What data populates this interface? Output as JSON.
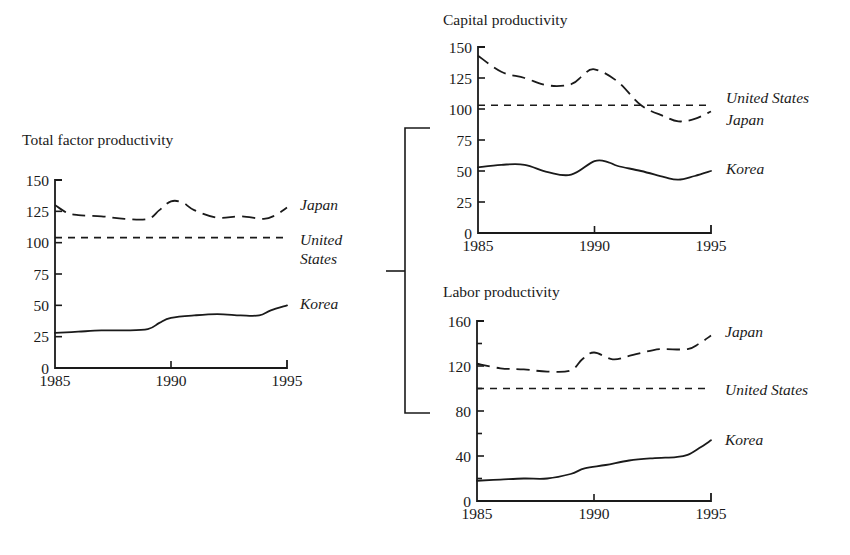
{
  "figure": {
    "bracket": {
      "x": 405,
      "top": 128,
      "bottom": 413,
      "arm_right": 430,
      "mid_y": 271,
      "stub_left": 386
    }
  },
  "chart_data": [
    {
      "id": "tfp",
      "type": "line",
      "title": "Total factor productivity",
      "xlabel": "",
      "ylabel": "",
      "x_ticks": [
        1985,
        1990,
        1995
      ],
      "y_ticks": [
        0,
        25,
        50,
        75,
        100,
        125,
        150
      ],
      "xlim": [
        1985,
        1995
      ],
      "ylim": [
        0,
        150
      ],
      "grid": false,
      "legend_position": "inline-right",
      "layout": {
        "title_x": 22,
        "title_y": 145,
        "x0": 55,
        "x1": 287,
        "y_top": 180,
        "y_bottom": 368
      },
      "series": [
        {
          "name": "Japan",
          "style": "longdash",
          "label_lines": [
            "Japan"
          ],
          "label_x": 300,
          "label_y": 210,
          "x": [
            1985,
            1985.5,
            1986,
            1987,
            1988,
            1989,
            1989.5,
            1990,
            1990.5,
            1991,
            1992,
            1993,
            1994,
            1994.5,
            1995
          ],
          "values": [
            130,
            124,
            122,
            121,
            119,
            119,
            126,
            133,
            132,
            126,
            120,
            121,
            119,
            122,
            128
          ]
        },
        {
          "name": "United States",
          "style": "shortdash",
          "label_lines": [
            "United",
            "States"
          ],
          "label_x": 300,
          "label_y": 245,
          "x": [
            1985,
            1995
          ],
          "values": [
            104,
            104
          ]
        },
        {
          "name": "Korea",
          "style": "solid",
          "label_lines": [
            "Korea"
          ],
          "label_x": 300,
          "label_y": 309,
          "x": [
            1985,
            1986,
            1987,
            1988,
            1989,
            1989.5,
            1990,
            1991,
            1992,
            1993,
            1993.8,
            1994.3,
            1995
          ],
          "values": [
            28,
            29,
            30,
            30,
            31,
            36,
            40,
            42,
            43,
            42,
            42,
            46,
            50
          ]
        }
      ]
    },
    {
      "id": "capital",
      "type": "line",
      "title": "Capital productivity",
      "xlabel": "",
      "ylabel": "",
      "x_ticks": [
        1985,
        1990,
        1995
      ],
      "y_ticks": [
        0,
        25,
        50,
        75,
        100,
        125,
        150
      ],
      "xlim": [
        1985,
        1995
      ],
      "ylim": [
        0,
        150
      ],
      "grid": false,
      "legend_position": "inline-right",
      "layout": {
        "title_x": 443,
        "title_y": 25,
        "x0": 478,
        "x1": 711,
        "y_top": 47,
        "y_bottom": 233
      },
      "series": [
        {
          "name": "Japan",
          "style": "longdash",
          "label_lines": [
            "Japan"
          ],
          "label_x": 726,
          "label_y": 125,
          "x": [
            1985,
            1986,
            1987,
            1988,
            1989,
            1989.5,
            1990,
            1991,
            1992,
            1993,
            1993.6,
            1994.3,
            1995
          ],
          "values": [
            143,
            130,
            125,
            119,
            120,
            127,
            132,
            122,
            103,
            94,
            90,
            92,
            98
          ]
        },
        {
          "name": "United States",
          "style": "shortdash",
          "label_lines": [
            "United States"
          ],
          "label_x": 726,
          "label_y": 103,
          "x": [
            1985,
            1995
          ],
          "values": [
            103,
            103
          ]
        },
        {
          "name": "Korea",
          "style": "solid",
          "label_lines": [
            "Korea"
          ],
          "label_x": 726,
          "label_y": 174,
          "x": [
            1985,
            1986,
            1987,
            1988,
            1989,
            1990,
            1990.6,
            1991,
            1992,
            1993,
            1993.6,
            1994.3,
            1995
          ],
          "values": [
            53,
            55,
            55,
            49,
            47,
            58,
            57,
            54,
            50,
            45,
            43,
            46,
            50
          ]
        }
      ]
    },
    {
      "id": "labor",
      "type": "line",
      "title": "Labor productivity",
      "xlabel": "",
      "ylabel": "",
      "x_ticks": [
        1985,
        1990,
        1995
      ],
      "y_ticks": [
        0,
        40,
        80,
        120,
        160
      ],
      "y_minor_ticks": [
        20,
        60,
        100,
        140
      ],
      "xlim": [
        1985,
        1995
      ],
      "ylim": [
        0,
        160
      ],
      "grid": false,
      "legend_position": "inline-right",
      "layout": {
        "title_x": 443,
        "title_y": 297,
        "x0": 477,
        "x1": 711,
        "y_top": 321,
        "y_bottom": 501
      },
      "series": [
        {
          "name": "Japan",
          "style": "longdash",
          "label_lines": [
            "Japan"
          ],
          "label_x": 725,
          "label_y": 337,
          "x": [
            1985,
            1986,
            1987,
            1988,
            1989,
            1989.5,
            1990,
            1990.8,
            1991.5,
            1992.5,
            1993,
            1994,
            1994.5,
            1995
          ],
          "values": [
            122,
            118,
            117,
            115,
            116,
            126,
            132,
            126,
            129,
            134,
            135,
            135,
            140,
            147
          ]
        },
        {
          "name": "United States",
          "style": "shortdash",
          "label_lines": [
            "United States"
          ],
          "label_x": 725,
          "label_y": 395,
          "x": [
            1985,
            1995
          ],
          "values": [
            100,
            100
          ]
        },
        {
          "name": "Korea",
          "style": "solid",
          "label_lines": [
            "Korea"
          ],
          "label_x": 725,
          "label_y": 445,
          "x": [
            1985,
            1986,
            1987,
            1988,
            1989,
            1989.6,
            1990.5,
            1991.5,
            1992.5,
            1993.5,
            1994,
            1994.5,
            1995
          ],
          "values": [
            18,
            19,
            20,
            20,
            24,
            29,
            32,
            36,
            38,
            39,
            41,
            47,
            54
          ]
        }
      ]
    }
  ]
}
